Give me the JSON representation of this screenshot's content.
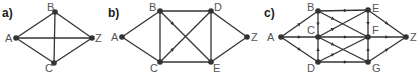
{
  "colors": {
    "edge": "#333333",
    "node": "#333333",
    "node_label": "#555555",
    "panel_label": "#1a1a1a",
    "background": "#ffffff"
  },
  "graphs": [
    {
      "id": "a",
      "label": "a)",
      "label_pos": [
        2,
        17
      ],
      "directed": false,
      "nodes": [
        {
          "id": "A",
          "x": 16,
          "y": 38,
          "lx": 5,
          "ly": 42
        },
        {
          "id": "B",
          "x": 55,
          "y": 12,
          "lx": 47,
          "ly": 11
        },
        {
          "id": "C",
          "x": 54,
          "y": 63,
          "lx": 45,
          "ly": 72
        },
        {
          "id": "Z",
          "x": 92,
          "y": 38,
          "lx": 95,
          "ly": 42
        }
      ],
      "edges": [
        [
          "A",
          "B"
        ],
        [
          "A",
          "C"
        ],
        [
          "A",
          "Z"
        ],
        [
          "B",
          "C"
        ],
        [
          "B",
          "Z"
        ],
        [
          "C",
          "Z"
        ]
      ],
      "arrows": []
    },
    {
      "id": "b",
      "label": "b)",
      "label_pos": [
        108,
        17
      ],
      "directed": false,
      "nodes": [
        {
          "id": "A",
          "x": 122,
          "y": 37,
          "lx": 111,
          "ly": 41
        },
        {
          "id": "B",
          "x": 160,
          "y": 11,
          "lx": 149,
          "ly": 11
        },
        {
          "id": "C",
          "x": 160,
          "y": 62,
          "lx": 150,
          "ly": 72
        },
        {
          "id": "D",
          "x": 211,
          "y": 11,
          "lx": 214,
          "ly": 11
        },
        {
          "id": "E",
          "x": 211,
          "y": 62,
          "lx": 213,
          "ly": 72
        },
        {
          "id": "Z",
          "x": 247,
          "y": 37,
          "lx": 251,
          "ly": 41
        }
      ],
      "edges": [
        [
          "A",
          "B"
        ],
        [
          "A",
          "C"
        ],
        [
          "B",
          "C"
        ],
        [
          "B",
          "D"
        ],
        [
          "B",
          "E"
        ],
        [
          "C",
          "D"
        ],
        [
          "C",
          "E"
        ],
        [
          "D",
          "E"
        ],
        [
          "D",
          "Z"
        ],
        [
          "E",
          "Z"
        ]
      ],
      "arrows": [
        {
          "from": "B",
          "to": "E",
          "t": 0.25
        },
        {
          "from": "C",
          "to": "D",
          "t": 0.25
        }
      ]
    },
    {
      "id": "c",
      "label": "c)",
      "label_pos": [
        264,
        17
      ],
      "directed": true,
      "nodes": [
        {
          "id": "A",
          "x": 281,
          "y": 37,
          "lx": 267,
          "ly": 41
        },
        {
          "id": "B",
          "x": 318,
          "y": 11,
          "lx": 307,
          "ly": 11
        },
        {
          "id": "C",
          "x": 318,
          "y": 37,
          "lx": 307,
          "ly": 34
        },
        {
          "id": "D",
          "x": 318,
          "y": 62,
          "lx": 307,
          "ly": 72
        },
        {
          "id": "E",
          "x": 368,
          "y": 10,
          "lx": 372,
          "ly": 12
        },
        {
          "id": "F",
          "x": 368,
          "y": 37,
          "lx": 372,
          "ly": 34
        },
        {
          "id": "G",
          "x": 368,
          "y": 62,
          "lx": 372,
          "ly": 72
        },
        {
          "id": "Z",
          "x": 406,
          "y": 37,
          "lx": 410,
          "ly": 41
        }
      ],
      "edges": [
        [
          "A",
          "B"
        ],
        [
          "A",
          "C"
        ],
        [
          "A",
          "D"
        ],
        [
          "B",
          "C"
        ],
        [
          "B",
          "E"
        ],
        [
          "B",
          "F"
        ],
        [
          "C",
          "E"
        ],
        [
          "C",
          "F"
        ],
        [
          "C",
          "G"
        ],
        [
          "D",
          "C"
        ],
        [
          "D",
          "F"
        ],
        [
          "D",
          "G"
        ],
        [
          "E",
          "F"
        ],
        [
          "G",
          "F"
        ],
        [
          "E",
          "Z"
        ],
        [
          "F",
          "Z"
        ],
        [
          "G",
          "Z"
        ]
      ],
      "arrows": [
        {
          "from": "A",
          "to": "B",
          "t": 0.5
        },
        {
          "from": "A",
          "to": "C",
          "t": 0.5
        },
        {
          "from": "A",
          "to": "D",
          "t": 0.5
        },
        {
          "from": "B",
          "to": "C",
          "t": 0.5
        },
        {
          "from": "B",
          "to": "E",
          "t": 0.55
        },
        {
          "from": "C",
          "to": "F",
          "t": 0.55
        },
        {
          "from": "D",
          "to": "C",
          "t": 0.5
        },
        {
          "from": "D",
          "to": "G",
          "t": 0.55
        },
        {
          "from": "E",
          "to": "F",
          "t": 0.5
        },
        {
          "from": "G",
          "to": "F",
          "t": 0.5
        },
        {
          "from": "E",
          "to": "Z",
          "t": 0.5
        },
        {
          "from": "F",
          "to": "Z",
          "t": 0.5
        },
        {
          "from": "G",
          "to": "Z",
          "t": 0.5
        },
        {
          "from": "B",
          "to": "F",
          "t": 0.3
        },
        {
          "from": "C",
          "to": "E",
          "t": 0.3
        },
        {
          "from": "C",
          "to": "G",
          "t": 0.3
        },
        {
          "from": "D",
          "to": "F",
          "t": 0.3
        }
      ]
    }
  ]
}
